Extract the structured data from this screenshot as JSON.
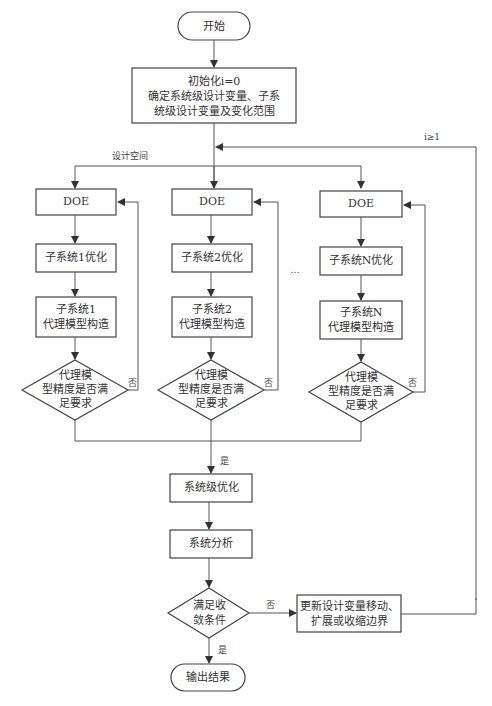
{
  "flowchart": {
    "start": "开始",
    "init": {
      "line1": "初始化i=0",
      "line2": "确定系统级设计变量、子系",
      "line3": "统级设计变量及变化范围"
    },
    "loop_label": "i≥1",
    "design_space_label": "设计空间",
    "columns": [
      {
        "doe": "DOE",
        "optimize": "子系统1优化",
        "surrogate_line1": "子系统1",
        "surrogate_line2": "代理模型构造",
        "decision_line1": "代理模",
        "decision_line2": "型精度是否满",
        "decision_line3": "足要求",
        "no_label": "否"
      },
      {
        "doe": "DOE",
        "optimize": "子系统2优化",
        "surrogate_line1": "子系统2",
        "surrogate_line2": "代理模型构造",
        "decision_line1": "代理模",
        "decision_line2": "型精度是否满",
        "decision_line3": "足要求",
        "no_label": "否"
      },
      {
        "doe": "DOE",
        "optimize": "子系统N优化",
        "surrogate_line1": "子系统N",
        "surrogate_line2": "代理模型构造",
        "decision_line1": "代理模",
        "decision_line2": "型精度是否满",
        "decision_line3": "足要求",
        "no_label": "否"
      }
    ],
    "ellipsis": "…",
    "yes_label_1": "是",
    "system_opt": "系统级优化",
    "system_analysis": "系统分析",
    "convergence": {
      "line1": "满足收",
      "line2": "敛条件"
    },
    "no_label_conv": "否",
    "update": {
      "line1": "更新设计变量移动、",
      "line2": "扩展或收缩边界"
    },
    "yes_label_2": "是",
    "output": "输出结果"
  }
}
